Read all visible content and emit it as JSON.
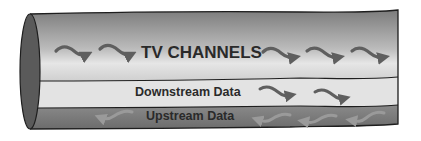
{
  "diagram": {
    "bands": [
      {
        "id": "tv",
        "label": "TV CHANNELS",
        "direction": "downstream",
        "arrow_count": 5,
        "color": "#b8b8b8"
      },
      {
        "id": "downstream",
        "label": "Downstream Data",
        "direction": "downstream",
        "arrow_count": 2,
        "color": "#e2e2e2"
      },
      {
        "id": "upstream",
        "label": "Upstream Data",
        "direction": "upstream",
        "arrow_count": 4,
        "color": "#7a7a7a"
      }
    ],
    "colors": {
      "cable_end": "#5a5a5a",
      "outline": "#1e1e1e",
      "arrow_dark": "#5f5f5f",
      "arrow_light": "#9a9a9a",
      "text": "#2a2a2a"
    }
  }
}
